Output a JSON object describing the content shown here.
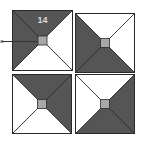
{
  "diagram": {
    "colors": {
      "dark": "#555555",
      "light": "#ffffff",
      "center": "#a8a8a8",
      "stroke": "#2a2a2a",
      "label": "#d8d8d8"
    },
    "tiles": [
      {
        "id": "top-left",
        "x": 12,
        "y": 10,
        "size": 61,
        "dark": [
          "top",
          "left"
        ],
        "label": "14"
      },
      {
        "id": "top-right",
        "x": 75,
        "y": 13,
        "size": 60,
        "dark": [
          "left",
          "bottom"
        ]
      },
      {
        "id": "bottom-left",
        "x": 12,
        "y": 74,
        "size": 60,
        "dark": [
          "top",
          "right"
        ]
      },
      {
        "id": "bottom-right",
        "x": 75,
        "y": 74,
        "size": 60,
        "dark": [
          "right",
          "bottom"
        ]
      }
    ],
    "callout": {
      "marker": "a",
      "target": "top-left center square"
    }
  }
}
